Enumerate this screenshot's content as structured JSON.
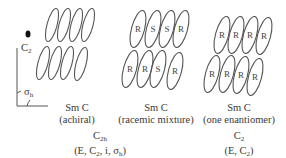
{
  "axes": {
    "c2_label": "C",
    "c2_sub": "2",
    "sigma_label": "σ",
    "sigma_sub": "h"
  },
  "panels": [
    {
      "name": "achiral",
      "phase": "Sm C",
      "description": "(achiral)",
      "top_row": [
        "",
        "",
        "",
        ""
      ],
      "bottom_row": [
        "",
        "",
        "",
        ""
      ]
    },
    {
      "name": "racemic",
      "phase": "Sm C",
      "description": "(racemic mixture)",
      "top_row": [
        "R",
        "S",
        "S",
        "R"
      ],
      "bottom_row": [
        "R",
        "R",
        "S",
        "R"
      ]
    },
    {
      "name": "enantiomer",
      "phase": "Sm C",
      "description": "(one enantiomer)",
      "top_row": [
        "R",
        "R",
        "R",
        "R"
      ],
      "bottom_row": [
        "R",
        "R",
        "R",
        "R"
      ]
    }
  ],
  "symmetry": [
    {
      "group": "C",
      "group_sub": "2h",
      "elements_prefix": "(E, C",
      "elements_sub": "2",
      "elements_suffix": ", i, σ",
      "elements_sub2": "h",
      "elements_end": ")"
    },
    {
      "group": "C",
      "group_sub": "2",
      "elements_prefix": "(E, C",
      "elements_sub": "2",
      "elements_end": ")"
    }
  ]
}
